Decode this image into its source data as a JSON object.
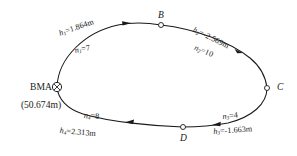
{
  "diagram": {
    "type": "leveling-loop",
    "benchmark": {
      "symbol": "crossed-circle",
      "name_prefix": "BM",
      "name_point": "A",
      "elevation_text": "(50.674m)",
      "elevation_value": 50.674,
      "units": "m"
    },
    "points": [
      {
        "id": "A",
        "label": "A",
        "marker": "crossed-circle",
        "x": 57,
        "y": 87
      },
      {
        "id": "B",
        "label": "B",
        "marker": "open-circle",
        "x": 161,
        "y": 25
      },
      {
        "id": "C",
        "label": "C",
        "marker": "open-circle",
        "x": 267,
        "y": 88
      },
      {
        "id": "D",
        "label": "D",
        "marker": "open-circle",
        "x": 183,
        "y": 127
      }
    ],
    "segments": [
      {
        "id": "seg1",
        "from": "A",
        "to": "B",
        "h_label": "h",
        "h_sub": "1",
        "h_text": "h₁=1.864m",
        "h_value": 1.864,
        "n_label": "n",
        "n_sub": "1",
        "n_text": "n₁=7",
        "n_value": 7
      },
      {
        "id": "seg2",
        "from": "B",
        "to": "C",
        "h_label": "h",
        "h_sub": "2",
        "h_text": "h₂=-2.569m",
        "h_value": -2.569,
        "n_label": "n",
        "n_sub": "2",
        "n_text": "n₂=10",
        "n_value": 10
      },
      {
        "id": "seg3",
        "from": "C",
        "to": "D",
        "h_label": "h",
        "h_sub": "3",
        "h_text": "h₃=-1.663m",
        "h_value": -1.663,
        "n_label": "n",
        "n_sub": "3",
        "n_text": "n₃=4",
        "n_value": 4
      },
      {
        "id": "seg4",
        "from": "D",
        "to": "A",
        "h_label": "h",
        "h_sub": "4",
        "h_text": "h₄=2.313m",
        "h_value": 2.313,
        "n_label": "n",
        "n_sub": "4",
        "n_text": "n₄=8",
        "n_value": 8
      }
    ],
    "segment_values": {
      "h1_eq": "=1.864m",
      "n1_eq": "=7",
      "h2_eq": "=-2.569m",
      "n2_eq": "=10",
      "h3_eq": "=-1.663m",
      "n3_eq": "=4",
      "h4_eq": "=2.313m",
      "n4_eq": "=8"
    },
    "letters": {
      "h": "h",
      "n": "n",
      "s1": "1",
      "s2": "2",
      "s3": "3",
      "s4": "4",
      "A": "A",
      "B": "B",
      "C": "C",
      "D": "D"
    },
    "colors": {
      "line": "#1a1a1a",
      "text": "#151515",
      "background": "#ffffff"
    }
  }
}
